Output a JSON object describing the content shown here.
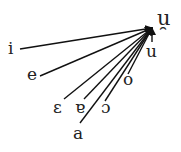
{
  "diagram": {
    "target": {
      "label": "u̯",
      "x": 152,
      "y": 28,
      "lx": 157,
      "ly": 8
    },
    "sources": [
      {
        "label": "i",
        "x": 20,
        "y": 49,
        "lx": 8,
        "ly": 40
      },
      {
        "label": "e",
        "x": 40,
        "y": 76,
        "lx": 27,
        "ly": 66
      },
      {
        "label": "ɛ",
        "x": 64,
        "y": 99,
        "lx": 53,
        "ly": 99
      },
      {
        "label": "ɐ",
        "x": 84,
        "y": 99,
        "lx": 75,
        "ly": 99
      },
      {
        "label": "ɔ",
        "x": 105,
        "y": 101,
        "lx": 101,
        "ly": 99
      },
      {
        "label": "a",
        "x": 80,
        "y": 123,
        "lx": 73,
        "ly": 125
      },
      {
        "label": "o",
        "x": 128,
        "y": 74,
        "lx": 123,
        "ly": 71
      },
      {
        "label": "u",
        "x": 152,
        "y": 42,
        "lx": 146,
        "ly": 43
      }
    ]
  }
}
